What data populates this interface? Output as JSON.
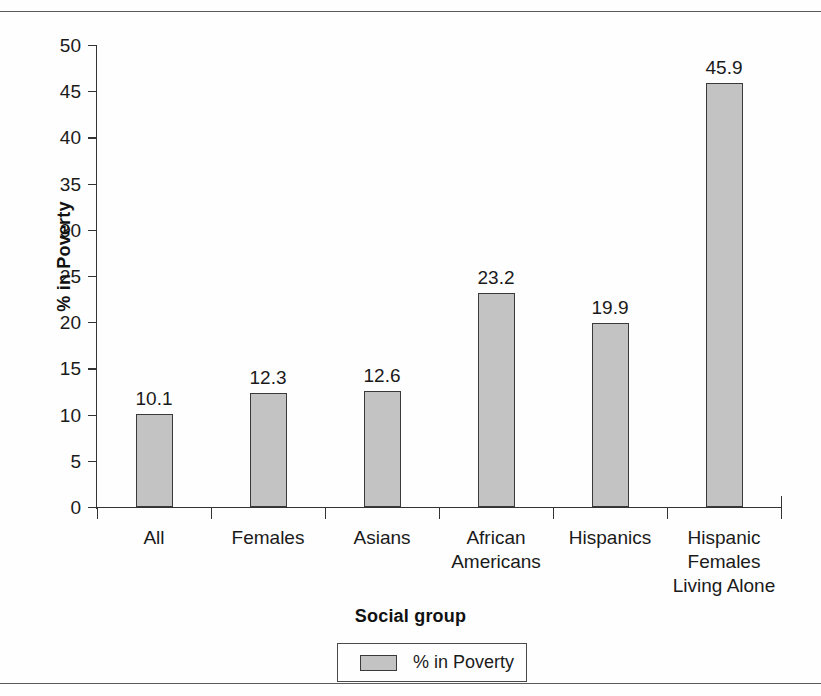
{
  "chart_data": {
    "type": "bar",
    "title": "",
    "subtitle": "",
    "xlabel": "Social group",
    "ylabel": "% in Poverty",
    "categories": [
      "All",
      "Females",
      "Asians",
      "African\nAmericans",
      "Hispanics",
      "Hispanic\nFemales\nLiving Alone"
    ],
    "values": [
      10.1,
      12.3,
      12.6,
      23.2,
      19.9,
      45.9
    ],
    "value_labels": [
      "10.1",
      "12.3",
      "12.6",
      "23.2",
      "19.9",
      "45.9"
    ],
    "series": [
      {
        "name": "% in Poverty",
        "values": [
          10.1,
          12.3,
          12.6,
          23.2,
          19.9,
          45.9
        ]
      }
    ],
    "ylim": [
      0,
      50
    ],
    "ytick_step": 5,
    "ytick_labels": [
      "50",
      "45",
      "40",
      "35",
      "30",
      "25",
      "20",
      "15",
      "10",
      "5",
      "0"
    ],
    "grid": false,
    "legend": {
      "position": "bottom",
      "entries": [
        "% in Poverty"
      ]
    },
    "colors": {
      "bar_fill": "#c3c3c3",
      "bar_stroke": "#3a3a3a",
      "axis": "#333333",
      "text": "#1a1a1a",
      "background": "#fefefe"
    }
  }
}
